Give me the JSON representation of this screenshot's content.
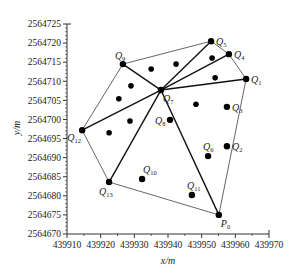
{
  "chart_data": {
    "type": "scatter",
    "title": "",
    "xlabel": "x/m",
    "ylabel": "y/m",
    "xlim": [
      439910,
      439970
    ],
    "ylim": [
      2564670,
      2564725
    ],
    "xticks": [
      439910,
      439920,
      439930,
      439940,
      439950,
      439960,
      439970
    ],
    "yticks": [
      2564670,
      2564675,
      2564680,
      2564685,
      2564690,
      2564695,
      2564700,
      2564705,
      2564710,
      2564715,
      2564720,
      2564725
    ],
    "xtick_labels": [
      "439910",
      "439920",
      "439930",
      "439940",
      "439950",
      "439960",
      "439970"
    ],
    "ytick_labels": [
      "2564670",
      "2564675",
      "2564680",
      "2564685",
      "2564690",
      "2564695",
      "2564700",
      "2564705",
      "2564710",
      "2564715",
      "2564720",
      "2564725"
    ],
    "grid": false,
    "labeled_points": [
      {
        "name": "P",
        "sub": "0",
        "x": 439955.1,
        "y": 2564675.0,
        "label_pos": "bottom-right"
      },
      {
        "name": "Q",
        "sub": "1",
        "x": 439963.2,
        "y": 2564710.6,
        "label_pos": "right"
      },
      {
        "name": "Q",
        "sub": "2",
        "x": 439957.5,
        "y": 2564693.0,
        "label_pos": "right"
      },
      {
        "name": "Q",
        "sub": "3",
        "x": 439957.5,
        "y": 2564703.3,
        "label_pos": "right"
      },
      {
        "name": "Q",
        "sub": "4",
        "x": 439958.1,
        "y": 2564717.1,
        "label_pos": "right"
      },
      {
        "name": "Q",
        "sub": "5",
        "x": 439952.8,
        "y": 2564720.5,
        "label_pos": "right"
      },
      {
        "name": "Q",
        "sub": "6",
        "x": 439951.9,
        "y": 2564690.4,
        "label_pos": "top"
      },
      {
        "name": "Q",
        "sub": "7",
        "x": 439937.9,
        "y": 2564707.7,
        "label_pos": "bottom-right"
      },
      {
        "name": "Q",
        "sub": "8",
        "x": 439940.6,
        "y": 2564699.9,
        "label_pos": "left"
      },
      {
        "name": "Q",
        "sub": "9",
        "x": 439926.6,
        "y": 2564714.5,
        "label_pos": "top-left"
      },
      {
        "name": "Q",
        "sub": "10",
        "x": 439932.3,
        "y": 2564684.4,
        "label_pos": "top-right"
      },
      {
        "name": "Q",
        "sub": "11",
        "x": 439947.1,
        "y": 2564680.2,
        "label_pos": "top"
      },
      {
        "name": "Q",
        "sub": "12",
        "x": 439914.5,
        "y": 2564697.2,
        "label_pos": "bottom-left"
      },
      {
        "name": "Q",
        "sub": "13",
        "x": 439922.5,
        "y": 2564683.6,
        "label_pos": "bottom"
      }
    ],
    "unlabeled_points": [
      {
        "x": 439935.0,
        "y": 2564713.2
      },
      {
        "x": 439942.4,
        "y": 2564714.5
      },
      {
        "x": 439953.1,
        "y": 2564716.1
      },
      {
        "x": 439954.0,
        "y": 2564710.9
      },
      {
        "x": 439929.0,
        "y": 2564708.8
      },
      {
        "x": 439925.4,
        "y": 2564705.4
      },
      {
        "x": 439928.7,
        "y": 2564699.6
      },
      {
        "x": 439922.5,
        "y": 2564696.5
      },
      {
        "x": 439948.3,
        "y": 2564704.0
      }
    ],
    "thin_edges": [
      [
        "Q9",
        "Q5"
      ],
      [
        "Q5",
        "Q4"
      ],
      [
        "Q4",
        "Q1"
      ],
      [
        "Q1",
        "P0"
      ],
      [
        "Q9",
        "Q12"
      ],
      [
        "Q12",
        "Q13"
      ],
      [
        "Q13",
        "P0"
      ]
    ],
    "thick_edges": [
      [
        "Q7",
        "Q5"
      ],
      [
        "Q7",
        "Q4"
      ],
      [
        "Q7",
        "Q1"
      ],
      [
        "Q7",
        "Q9"
      ],
      [
        "Q7",
        "Q12"
      ],
      [
        "Q7",
        "Q13"
      ],
      [
        "Q7",
        "P0"
      ]
    ]
  }
}
